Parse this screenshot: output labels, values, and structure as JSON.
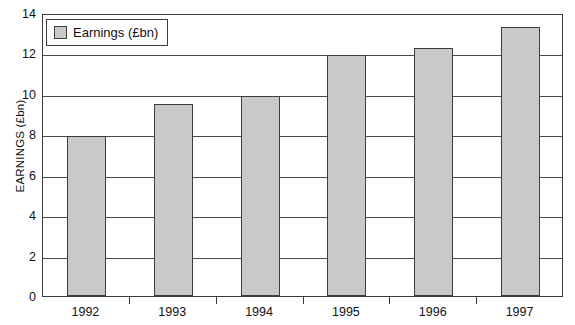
{
  "chart_data": {
    "type": "bar",
    "title": "",
    "xlabel": "",
    "ylabel": "EARNINGS (£bn)",
    "categories": [
      "1992",
      "1993",
      "1994",
      "1995",
      "1996",
      "1997"
    ],
    "values": [
      7.9,
      9.5,
      9.9,
      11.9,
      12.25,
      13.3
    ],
    "series": [
      {
        "name": "Earnings (£bn)",
        "values": [
          7.9,
          9.5,
          9.9,
          11.9,
          12.25,
          13.3
        ]
      }
    ],
    "ylim": [
      0,
      14
    ],
    "yticks": [
      0,
      2,
      4,
      6,
      8,
      10,
      12,
      14
    ],
    "ytick_labels": [
      "0",
      "2",
      "4",
      "6",
      "8",
      "10",
      "12",
      "14"
    ],
    "grid": true,
    "legend_position": "top-left",
    "legend_entries": [
      "Earnings (£bn)"
    ],
    "bar_fill_color": "#c9c9c9",
    "bar_border_color": "#3d3d3d",
    "axis_color": "#3b3b3b",
    "background_color": "#ffffff"
  },
  "legend": {
    "label": "Earnings (£bn)"
  }
}
